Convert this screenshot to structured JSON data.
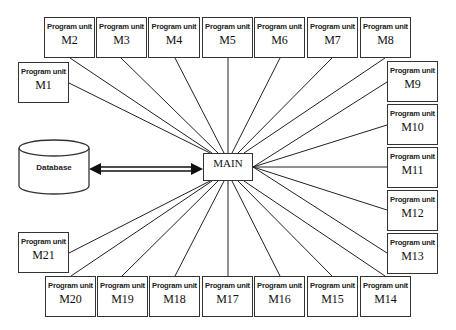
{
  "diagram": {
    "main": {
      "label": "MAIN",
      "x": 203,
      "y": 153,
      "w": 50,
      "h": 28
    },
    "database": {
      "label": "Database",
      "x": 19,
      "y": 140,
      "w": 70,
      "h": 54
    },
    "arrow": {
      "type": "double-headed",
      "from": "Database",
      "to": "MAIN"
    },
    "unit_caption": "Program unit",
    "units": [
      {
        "name": "M1",
        "x": 18,
        "y": 62,
        "w": 51,
        "h": 41
      },
      {
        "name": "M2",
        "x": 44,
        "y": 17,
        "w": 51,
        "h": 41
      },
      {
        "name": "M3",
        "x": 96,
        "y": 17,
        "w": 51,
        "h": 41
      },
      {
        "name": "M4",
        "x": 148,
        "y": 17,
        "w": 52,
        "h": 41
      },
      {
        "name": "M5",
        "x": 202,
        "y": 17,
        "w": 51,
        "h": 41
      },
      {
        "name": "M6",
        "x": 254,
        "y": 17,
        "w": 51,
        "h": 41
      },
      {
        "name": "M7",
        "x": 307,
        "y": 17,
        "w": 51,
        "h": 41
      },
      {
        "name": "M8",
        "x": 360,
        "y": 17,
        "w": 51,
        "h": 41
      },
      {
        "name": "M9",
        "x": 387,
        "y": 61,
        "w": 51,
        "h": 41
      },
      {
        "name": "M10",
        "x": 387,
        "y": 104,
        "w": 51,
        "h": 41
      },
      {
        "name": "M11",
        "x": 387,
        "y": 147,
        "w": 51,
        "h": 41
      },
      {
        "name": "M12",
        "x": 387,
        "y": 190,
        "w": 51,
        "h": 41
      },
      {
        "name": "M13",
        "x": 387,
        "y": 233,
        "w": 51,
        "h": 41
      },
      {
        "name": "M14",
        "x": 360,
        "y": 276,
        "w": 51,
        "h": 41
      },
      {
        "name": "M15",
        "x": 307,
        "y": 276,
        "w": 51,
        "h": 41
      },
      {
        "name": "M16",
        "x": 254,
        "y": 276,
        "w": 51,
        "h": 41
      },
      {
        "name": "M17",
        "x": 202,
        "y": 276,
        "w": 51,
        "h": 41
      },
      {
        "name": "M18",
        "x": 149,
        "y": 276,
        "w": 51,
        "h": 41
      },
      {
        "name": "M19",
        "x": 97,
        "y": 276,
        "w": 51,
        "h": 41
      },
      {
        "name": "M20",
        "x": 45,
        "y": 276,
        "w": 51,
        "h": 41
      },
      {
        "name": "M21",
        "x": 18,
        "y": 232,
        "w": 51,
        "h": 41
      }
    ],
    "links": [
      {
        "unit": "M1",
        "ux": 69,
        "uy": 83,
        "mx": 210,
        "my": 153
      },
      {
        "unit": "M2",
        "ux": 70,
        "uy": 58,
        "mx": 212,
        "my": 153
      },
      {
        "unit": "M3",
        "ux": 121,
        "uy": 58,
        "mx": 218,
        "my": 153
      },
      {
        "unit": "M4",
        "ux": 175,
        "uy": 58,
        "mx": 224,
        "my": 153
      },
      {
        "unit": "M5",
        "ux": 228,
        "uy": 58,
        "mx": 228,
        "my": 153
      },
      {
        "unit": "M6",
        "ux": 280,
        "uy": 58,
        "mx": 232,
        "my": 153
      },
      {
        "unit": "M7",
        "ux": 332,
        "uy": 58,
        "mx": 238,
        "my": 153
      },
      {
        "unit": "M8",
        "ux": 385,
        "uy": 58,
        "mx": 244,
        "my": 153
      },
      {
        "unit": "M9",
        "ux": 387,
        "uy": 82,
        "mx": 253,
        "my": 167
      },
      {
        "unit": "M10",
        "ux": 387,
        "uy": 125,
        "mx": 253,
        "my": 167
      },
      {
        "unit": "M11",
        "ux": 387,
        "uy": 167,
        "mx": 253,
        "my": 167
      },
      {
        "unit": "M12",
        "ux": 387,
        "uy": 210,
        "mx": 253,
        "my": 167
      },
      {
        "unit": "M13",
        "ux": 387,
        "uy": 253,
        "mx": 253,
        "my": 167
      },
      {
        "unit": "M14",
        "ux": 385,
        "uy": 276,
        "mx": 244,
        "my": 181
      },
      {
        "unit": "M15",
        "ux": 332,
        "uy": 276,
        "mx": 238,
        "my": 181
      },
      {
        "unit": "M16",
        "ux": 280,
        "uy": 276,
        "mx": 232,
        "my": 181
      },
      {
        "unit": "M17",
        "ux": 228,
        "uy": 276,
        "mx": 228,
        "my": 181
      },
      {
        "unit": "M18",
        "ux": 175,
        "uy": 276,
        "mx": 224,
        "my": 181
      },
      {
        "unit": "M19",
        "ux": 122,
        "uy": 276,
        "mx": 218,
        "my": 181
      },
      {
        "unit": "M20",
        "ux": 71,
        "uy": 276,
        "mx": 212,
        "my": 181
      },
      {
        "unit": "M21",
        "ux": 69,
        "uy": 253,
        "mx": 210,
        "my": 181
      }
    ]
  }
}
